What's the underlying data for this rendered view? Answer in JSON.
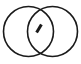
{
  "figure": {
    "name": "venn-diagram-two-circles-with-tick",
    "background_color": "#ffffff",
    "stroke_color": "#1a1a1a",
    "stroke_width": 1.6,
    "canvas": {
      "width": 81,
      "height": 64
    },
    "circles": [
      {
        "label": "left-circle",
        "cx": 28.5,
        "cy": 31.5,
        "r": 25.0
      },
      {
        "label": "right-circle",
        "cx": 52.5,
        "cy": 31.5,
        "r": 25.0
      }
    ],
    "intersection": {
      "label": "lens-region",
      "top_crossing": {
        "x": 40.5,
        "y": 8.0
      },
      "bottom_crossing": {
        "x": 40.5,
        "y": 55.0
      }
    },
    "tick_mark": {
      "label": "diagonal-slash",
      "x1": 36.6,
      "y1": 32.6,
      "x2": 41.4,
      "y2": 24.4,
      "stroke_width": 3.0,
      "color": "#1a1a1a"
    }
  }
}
